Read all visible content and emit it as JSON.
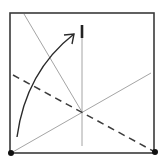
{
  "diagram": {
    "type": "origami-fold-diagram",
    "colors": {
      "background": "#ffffff",
      "square_edge": "#3a3a3a",
      "crease_line": "#9a9a9a",
      "valley_fold": "#3c3c3c",
      "arrow": "#2a2a2a",
      "corner_dot": "#111111",
      "reference_mark": "#222222"
    },
    "square": {
      "x1": 10,
      "y1": 13,
      "x2": 154,
      "y2": 153
    },
    "corner_dots": [
      {
        "name": "bottom-left-corner",
        "cx": 11,
        "cy": 153,
        "r": 3
      },
      {
        "name": "bottom-right-corner",
        "cx": 155,
        "cy": 152,
        "r": 3
      }
    ],
    "crease_lines": [
      {
        "name": "diagonal-crease-top-left",
        "x1": 24,
        "y1": 14,
        "x2": 82,
        "y2": 112
      },
      {
        "name": "diagonal-crease-bottom-left",
        "x1": 11,
        "y1": 153,
        "x2": 151,
        "y2": 73
      },
      {
        "name": "vertical-reference-line",
        "x1": 82,
        "y1": 25,
        "x2": 82,
        "y2": 146
      }
    ],
    "valley_fold": {
      "name": "dashed-valley-fold",
      "x1": 13,
      "y1": 75,
      "x2": 155,
      "y2": 152,
      "dash": "7,5"
    },
    "reference_mark": {
      "name": "thick-target-mark",
      "x1": 82,
      "y1": 25,
      "x2": 82,
      "y2": 38
    },
    "arrow": {
      "name": "fold-direction-arrow",
      "path": "M17,137 C22,100 38,62 74,34",
      "head": {
        "tip_x": 74,
        "tip_y": 34,
        "wing1": "64,35",
        "wing2": "72,44"
      }
    }
  }
}
